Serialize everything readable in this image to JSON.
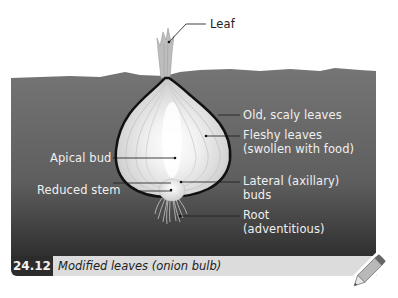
{
  "figure": {
    "number": "24.12",
    "caption": "Modified leaves (onion bulb)"
  },
  "labels": {
    "leaf": "Leaf",
    "old_scaly_leaves": "Old, scaly leaves",
    "fleshy_leaves_line1": "Fleshy leaves",
    "fleshy_leaves_line2": "(swollen with food)",
    "apical_bud": "Apical bud",
    "reduced_stem": "Reduced stem",
    "lateral_buds_line1": "Lateral (axillary)",
    "lateral_buds_line2": "buds",
    "root_line1": "Root",
    "root_line2": "(adventitious)"
  },
  "colors": {
    "soil": "#6e6e6e",
    "soil_dark": "#3a3a3a",
    "caption_num_bg": "#2c2c2c",
    "caption_bg": "#dcdcdc",
    "bulb_outline": "#111111"
  },
  "icons": {
    "pencil": "pencil-icon"
  }
}
